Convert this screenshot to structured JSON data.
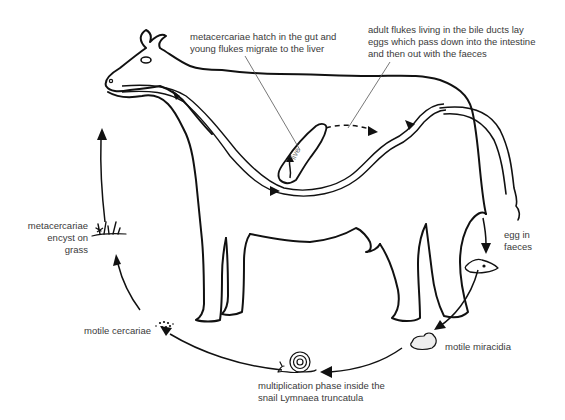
{
  "diagram": {
    "labels": {
      "hatch_line1": "metacercariae hatch in the gut and",
      "hatch_line2": "young flukes migrate to the liver",
      "adult_line1": "adult flukes living in the bile ducts lay",
      "adult_line2": "eggs which pass down into the intestine",
      "adult_line3": "and then out with the faeces",
      "liver": "live",
      "egg_line1": "egg in",
      "egg_line2": "faeces",
      "miracidia": "motile miracidia",
      "snail_line1": "multiplication phase inside the",
      "snail_line2": "snail Lymnaea truncatula",
      "cercariae": "motile cercariae",
      "encyst_line1": "metacercariae",
      "encyst_line2": "encyst on",
      "encyst_line3": "grass"
    },
    "stages": [
      {
        "id": "encyst",
        "icon": "grass-icon"
      },
      {
        "id": "hatch",
        "icon": "cow-icon"
      },
      {
        "id": "adult",
        "icon": "liver-icon"
      },
      {
        "id": "egg",
        "icon": "egg-icon"
      },
      {
        "id": "miracidia",
        "icon": "miracidia-icon"
      },
      {
        "id": "snail",
        "icon": "snail-icon"
      },
      {
        "id": "cercariae",
        "icon": "cercariae-icon"
      }
    ],
    "colors": {
      "line": "#111111",
      "text": "#3a3a3a",
      "background": "#ffffff"
    }
  }
}
